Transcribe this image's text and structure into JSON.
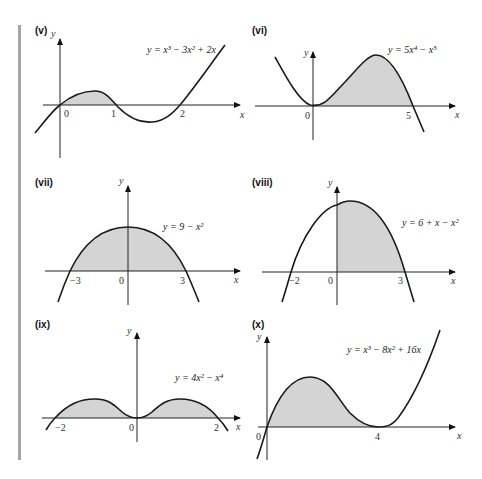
{
  "panels": [
    {
      "label": "(v)",
      "equation": "y = x³ − 3x² + 2x",
      "x_ticks": [
        "0",
        "1",
        "2"
      ],
      "x_axis": "x",
      "y_axis": "y"
    },
    {
      "label": "(vi)",
      "equation": "y = 5x⁴ − x⁵",
      "x_ticks": [
        "0",
        "5"
      ],
      "x_axis": "x",
      "y_axis": "y"
    },
    {
      "label": "(vii)",
      "equation": "y = 9 − x²",
      "x_ticks": [
        "−3",
        "0",
        "3"
      ],
      "x_axis": "x",
      "y_axis": "y"
    },
    {
      "label": "(viii)",
      "equation": "y = 6 + x − x²",
      "x_ticks": [
        "−2",
        "0",
        "3"
      ],
      "x_axis": "x",
      "y_axis": "y"
    },
    {
      "label": "(ix)",
      "equation": "y = 4x² − x⁴",
      "x_ticks": [
        "−2",
        "0",
        "2"
      ],
      "x_axis": "x",
      "y_axis": "y"
    },
    {
      "label": "(x)",
      "equation": "y = x³ − 8x² + 16x",
      "x_ticks": [
        "0",
        "4"
      ],
      "x_axis": "x",
      "y_axis": "y"
    }
  ],
  "colors": {
    "shade": "#d4d4d4",
    "curve": "#1a1a1a",
    "side_bar": "#a6a6a6"
  }
}
